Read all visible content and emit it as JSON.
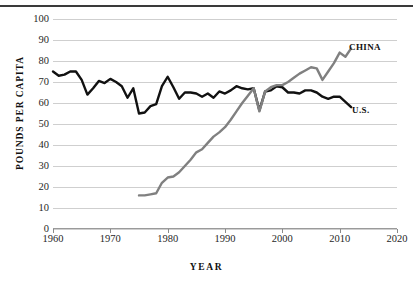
{
  "chart_data": {
    "type": "line",
    "title": "",
    "xlabel": "YEAR",
    "ylabel": "POUNDS PER CAPITA",
    "xlim": [
      1960,
      2020
    ],
    "ylim": [
      0,
      100
    ],
    "xticks": [
      1960,
      1970,
      1980,
      1990,
      2000,
      2010,
      2020
    ],
    "yticks": [
      0,
      10,
      20,
      30,
      40,
      50,
      60,
      70,
      80,
      90,
      100
    ],
    "grid": true,
    "legend_position": "inline-right-of-line-end",
    "series": [
      {
        "name": "U.S.",
        "color": "#111111",
        "label": "U.S.",
        "x": [
          1960,
          1961,
          1962,
          1963,
          1964,
          1965,
          1966,
          1967,
          1968,
          1969,
          1970,
          1971,
          1972,
          1973,
          1974,
          1975,
          1976,
          1977,
          1978,
          1979,
          1980,
          1981,
          1982,
          1983,
          1984,
          1985,
          1986,
          1987,
          1988,
          1989,
          1990,
          1991,
          1992,
          1993,
          1994,
          1995,
          1996,
          1997,
          1998,
          1999,
          2000,
          2001,
          2002,
          2003,
          2004,
          2005,
          2006,
          2007,
          2008,
          2009,
          2010,
          2011,
          2012
        ],
        "values": [
          75,
          73,
          73.5,
          75,
          75,
          71,
          64,
          67,
          70.5,
          69.5,
          71.5,
          70,
          68,
          62.5,
          67,
          55,
          55.5,
          58.5,
          59.5,
          68,
          72.5,
          67.5,
          62,
          65,
          65,
          64.5,
          63,
          64.5,
          62.5,
          65.5,
          64.5,
          66,
          68,
          67,
          66.5,
          67,
          56.5,
          65.5,
          66,
          68,
          67.5,
          65,
          65,
          64.5,
          66,
          66,
          65,
          63,
          62,
          63,
          63,
          60.5,
          58
        ]
      },
      {
        "name": "CHINA",
        "color": "#808080",
        "label": "CHINA",
        "x": [
          1975,
          1976,
          1977,
          1978,
          1979,
          1980,
          1981,
          1982,
          1983,
          1984,
          1985,
          1986,
          1987,
          1988,
          1989,
          1990,
          1991,
          1992,
          1993,
          1994,
          1995,
          1996,
          1997,
          1998,
          1999,
          2000,
          2001,
          2002,
          2003,
          2004,
          2005,
          2006,
          2007,
          2008,
          2009,
          2010,
          2011,
          2012
        ],
        "values": [
          16,
          16,
          16.5,
          17,
          22,
          24.5,
          25,
          27,
          30,
          33,
          36.5,
          38,
          41,
          44,
          46,
          48.5,
          52,
          56,
          60,
          63.5,
          67,
          56,
          65.5,
          67.5,
          68.5,
          68.5,
          70,
          72,
          74,
          75.5,
          77,
          76.5,
          71,
          75,
          79,
          84,
          82,
          86
        ]
      }
    ]
  },
  "axis": {
    "x_title": "YEAR",
    "y_title": "POUNDS PER CAPITA",
    "x_tick_labels": [
      "1960",
      "1970",
      "1980",
      "1990",
      "2000",
      "2010",
      "2020"
    ],
    "y_tick_labels": [
      "100",
      "90",
      "80",
      "70",
      "60",
      "50",
      "40",
      "30",
      "20",
      "10",
      "0"
    ]
  },
  "labels": {
    "china": "CHINA",
    "us": "U.S."
  },
  "colors": {
    "us_line": "#111111",
    "china_line": "#808080",
    "gridline": "#cfcfcf",
    "top_rule": "#3a3a3a",
    "background": "#ffffff",
    "text": "#1a1a1a"
  }
}
